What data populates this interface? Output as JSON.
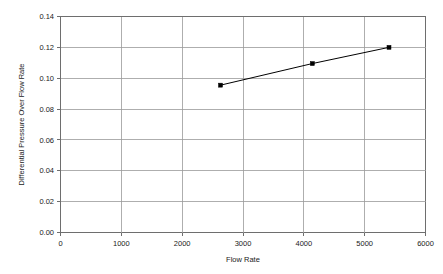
{
  "chart_data": {
    "type": "line",
    "title": "",
    "subtitle": "",
    "xlabel": "Flow Rate",
    "ylabel": "Differential Pressure Over Flow Rate",
    "xlim": [
      0,
      6000
    ],
    "ylim": [
      0.0,
      0.14
    ],
    "grid": true,
    "legend": false,
    "legend_position": "none",
    "x_ticks": [
      0,
      1000,
      2000,
      3000,
      4000,
      5000,
      6000
    ],
    "x_tick_labels": [
      "0",
      "1000",
      "2000",
      "3000",
      "4000",
      "5000",
      "6000"
    ],
    "y_ticks": [
      0.0,
      0.02,
      0.04,
      0.06,
      0.08,
      0.1,
      0.12,
      0.14
    ],
    "y_tick_labels": [
      "0.00",
      "0.02",
      "0.04",
      "0.06",
      "0.08",
      "0.10",
      "0.12",
      "0.14"
    ],
    "series": [
      {
        "name": "Differential Pressure Over Flow Rate",
        "color": "#000000",
        "marker": "square",
        "x": [
          2630,
          4140,
          5400
        ],
        "y": [
          0.0955,
          0.1095,
          0.12
        ]
      }
    ],
    "annotations": []
  },
  "axes": {
    "x_title": "Flow Rate",
    "y_title": "Differential Pressure Over Flow Rate"
  },
  "colors": {
    "background": "#ffffff",
    "grid": "#9a9a9a",
    "frame": "#6e6e6e",
    "series": "#000000",
    "text": "#1a1a1a"
  }
}
